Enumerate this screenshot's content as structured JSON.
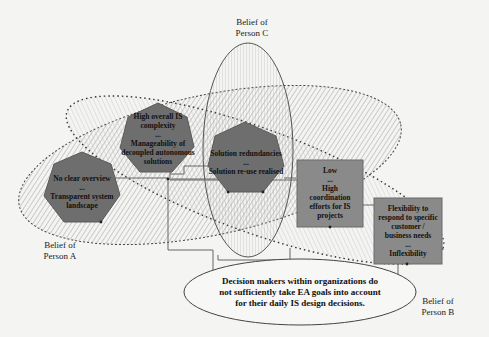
{
  "diagram": {
    "beliefs": [
      {
        "id": "A",
        "label_line1": "Belief of",
        "label_line2": "Person A"
      },
      {
        "id": "B",
        "label_line1": "Belief of",
        "label_line2": "Person B"
      },
      {
        "id": "C",
        "label_line1": "Belief of",
        "label_line2": "Person C"
      }
    ],
    "nodes": [
      {
        "id": "n1",
        "shape": "heptagon",
        "line1": "High overall IS",
        "line2": "complexity",
        "sep": "...",
        "line3": "Manageability of",
        "line4": "decoupled autonomous",
        "line5": "solutions"
      },
      {
        "id": "n2",
        "shape": "heptagon",
        "line1": "No clear overview",
        "sep": "...",
        "line2": "Transparent system",
        "line3": "landscape"
      },
      {
        "id": "n3",
        "shape": "heptagon",
        "line1": "Solution redundancies",
        "sep": "...",
        "line2": "Solution re-use realised"
      },
      {
        "id": "n4",
        "shape": "rectangle",
        "line1": "Low",
        "sep": "...",
        "line2": "High",
        "line3": "coordination",
        "line4": "efforts for IS",
        "line5": "projects"
      },
      {
        "id": "n5",
        "shape": "rectangle",
        "line1": "Flexibility to",
        "line2": "respond to specific",
        "line3": "customer /",
        "line4": "business needs",
        "sep": "...",
        "line5": "Inflexibility"
      }
    ],
    "claim": {
      "line1": "Decision makers within organizations do",
      "line2": "not sufficiently take EA goals into account",
      "line3": "for their daily IS design decisions."
    },
    "colors": {
      "background": "#f4f4f2",
      "node_fill": "#6e6e6e",
      "rect_fill": "#8a8a8a",
      "outline": "#555555"
    }
  }
}
